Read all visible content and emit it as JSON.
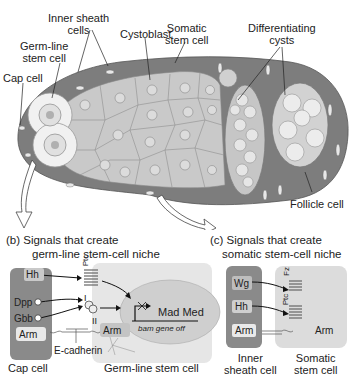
{
  "panel_a": {
    "labels": {
      "inner_sheath": [
        "Inner sheath",
        "cells"
      ],
      "cystoblast": "Cystoblast",
      "somatic_stem": [
        "Somatic",
        "stem cell"
      ],
      "differentiating": [
        "Differentiating",
        "cysts"
      ],
      "germline_stem": [
        "Germ-line",
        "stem cell"
      ],
      "cap_cell": "Cap cell",
      "follicle_cell": "Follicle cell"
    }
  },
  "panel_b": {
    "title_line1": "(b)  Signals that create",
    "title_line2": "germ-line stem-cell niche",
    "hh": "Hh",
    "ptc": "Ptc",
    "dpp": "Dpp",
    "gbb": "Gbb",
    "receptor_i": "I",
    "receptor_ii": "II",
    "arm_cap": "Arm",
    "arm_germ": "Arm",
    "mad_med": "Mad Med",
    "bam": "bam gene off",
    "ecadherin": "E-cadherin",
    "cap_cell": "Cap cell",
    "germline_cell": "Germ-line stem cell"
  },
  "panel_c": {
    "title_line1": "(c)  Signals that create",
    "title_line2": "somatic stem-cell niche",
    "wg": "Wg",
    "fz": "Fz",
    "hh": "Hh",
    "ptc": "Ptc",
    "arm_inner": "Arm",
    "arm_somatic": "Arm",
    "inner_sheath": [
      "Inner",
      "sheath cell"
    ],
    "somatic_stem": [
      "Somatic",
      "stem cell"
    ]
  },
  "colors": {
    "dark_gray": "#7a7a7a",
    "mid_gray": "#b5b5b5",
    "light_gray": "#d6d6d6",
    "pale": "#ececec"
  }
}
